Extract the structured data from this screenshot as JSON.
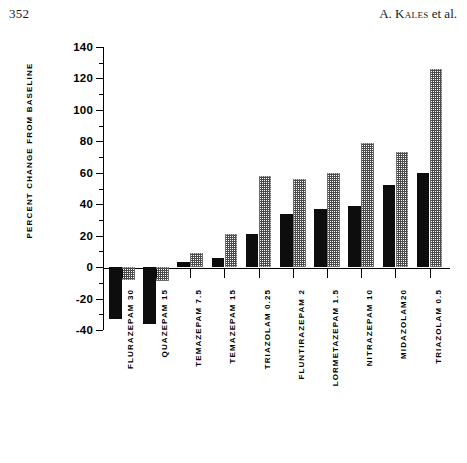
{
  "page": {
    "folio": "352",
    "running_head_prefix": "A. ",
    "running_head_author": "Kales",
    "running_head_suffix": " et al."
  },
  "chart_data": {
    "type": "bar",
    "title": "",
    "xlabel": "",
    "ylabel": "PERCENT CHANGE FROM BASELINE",
    "ylim": [
      -40,
      140
    ],
    "ytick_step": 20,
    "yminor_step": 10,
    "grid": false,
    "legend_position": "none",
    "categories": [
      "FLURAZEPAM 30",
      "QUAZEPAM 15",
      "TEMAZEPAM 7.5",
      "TEMAZEPAM 15",
      "TRIAZOLAM 0.25",
      "FLUNTIRAZEPAM 2",
      "LORMETAZEPAM 1.5",
      "NITRAZEPAM 10",
      "MIDAZOLAM20",
      "TRIAZOLAM 0.5"
    ],
    "ytick_labels": [
      "140",
      "120",
      "100",
      "80",
      "60",
      "40",
      "20",
      "0",
      "-20",
      "-40"
    ],
    "ytick_values": [
      140,
      120,
      100,
      80,
      60,
      40,
      20,
      0,
      -20,
      -40
    ],
    "series": [
      {
        "name": "solid",
        "fill": "solid-black",
        "color": "#0d0d0d",
        "values": [
          -33,
          -36,
          3,
          6,
          21,
          34,
          37,
          39,
          52,
          60
        ]
      },
      {
        "name": "hatched",
        "fill": "cross-hatch",
        "color": "#4a4a4a",
        "values": [
          -8,
          -9,
          9,
          21,
          58,
          56,
          60,
          79,
          73,
          126
        ]
      }
    ]
  }
}
